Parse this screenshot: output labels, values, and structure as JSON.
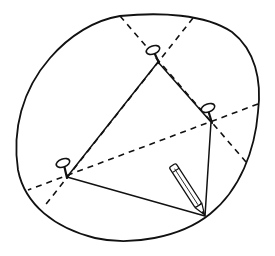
{
  "figure": {
    "description": "Pin-and-string construction: three pins, a taut string loop, and a pencil tracing a closed curve",
    "colors": {
      "ink": "#111111",
      "background": "#ffffff"
    },
    "icons": {
      "pins": [
        "pin-icon",
        "pin-icon",
        "pin-icon"
      ],
      "pencil": "pencil-icon"
    },
    "elements": {
      "curve": "traced-closed-curve",
      "string": "string-loop",
      "guides": [
        "dashed-guide-line",
        "dashed-guide-line",
        "dashed-guide-line"
      ]
    }
  }
}
